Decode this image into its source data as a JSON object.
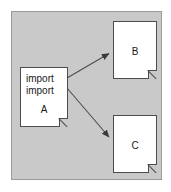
{
  "diagram": {
    "background_color": "#c9c9c9",
    "border_color": "#9a9a9a",
    "page_background": "#ffffff",
    "node_fill": "#ffffff",
    "node_stroke": "#4d4d4d",
    "arrow_color": "#4d4d4d",
    "nodes": [
      {
        "id": "A",
        "label": "A",
        "body_lines": [
          "import",
          "import"
        ],
        "x": 19,
        "y": 66,
        "width": 48,
        "height": 60
      },
      {
        "id": "B",
        "label": "B",
        "body_lines": [],
        "x": 112,
        "y": 20,
        "width": 44,
        "height": 58
      },
      {
        "id": "C",
        "label": "C",
        "body_lines": [],
        "x": 112,
        "y": 114,
        "width": 44,
        "height": 58
      }
    ],
    "edges": [
      {
        "id": "a-to-b",
        "from": "A",
        "to": "B",
        "label": "",
        "x1": 67,
        "y1": 78,
        "x2": 111,
        "y2": 52,
        "arrowhead": "filled-triangle"
      },
      {
        "id": "a-to-c",
        "from": "A",
        "to": "C",
        "label": "",
        "x1": 67,
        "y1": 88,
        "x2": 111,
        "y2": 139,
        "arrowhead": "filled-triangle"
      }
    ]
  }
}
